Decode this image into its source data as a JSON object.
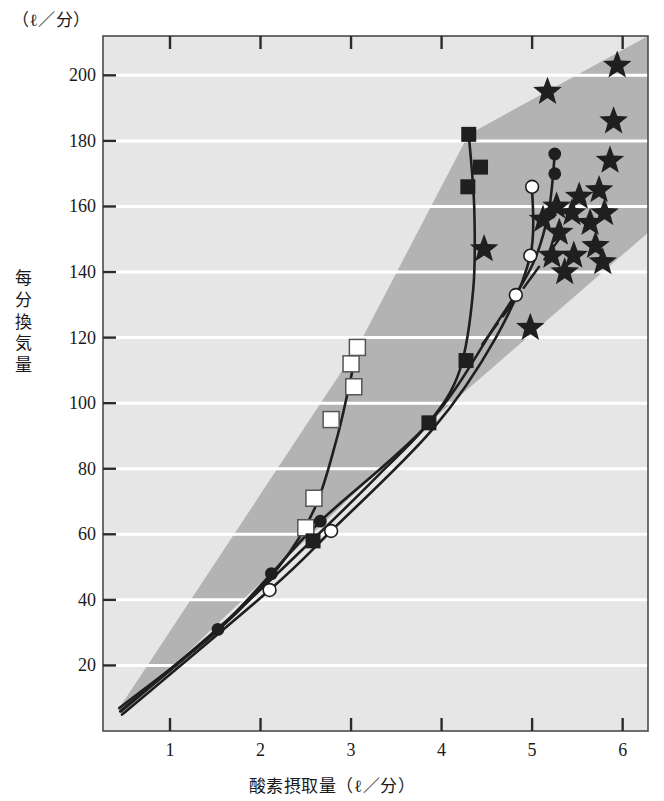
{
  "chart_data": {
    "type": "scatter",
    "title": "",
    "xlabel": "酸素摂取量（ℓ／分）",
    "ylabel": "每分換気量",
    "yunit_label": "（ℓ／分）",
    "xlim": [
      0.26,
      6.28
    ],
    "ylim": [
      0,
      212
    ],
    "xticks": [
      1,
      2,
      3,
      4,
      5,
      6
    ],
    "yticks": [
      20,
      40,
      60,
      80,
      100,
      120,
      140,
      160,
      180,
      200
    ],
    "grid": "horizontal-white-lines",
    "legend_position": "none",
    "colors": {
      "plot_background": "#e6e6e6",
      "band_fill": "#b3b3b3",
      "marker_dark": "#1f1f1f",
      "marker_open_fill": "#ffffff",
      "axis": "#4a4a4a",
      "gridline": "#ffffff"
    },
    "series": [
      {
        "name": "open-squares",
        "marker": "open-square",
        "points": [
          [
            2.5,
            62
          ],
          [
            2.59,
            71
          ],
          [
            2.78,
            95
          ],
          [
            3.03,
            105
          ],
          [
            3.0,
            112
          ],
          [
            3.07,
            117
          ]
        ]
      },
      {
        "name": "filled-squares",
        "marker": "filled-square",
        "points": [
          [
            2.58,
            58
          ],
          [
            3.86,
            94
          ],
          [
            4.27,
            113
          ],
          [
            4.29,
            166
          ],
          [
            4.43,
            172
          ],
          [
            4.3,
            182
          ]
        ]
      },
      {
        "name": "filled-circles",
        "marker": "filled-circle",
        "points": [
          [
            1.53,
            31
          ],
          [
            2.12,
            48
          ],
          [
            2.66,
            64
          ],
          [
            3.86,
            94
          ],
          [
            4.82,
            133
          ],
          [
            5.2,
            158
          ],
          [
            5.25,
            170
          ],
          [
            5.25,
            176
          ]
        ]
      },
      {
        "name": "open-circles",
        "marker": "open-circle",
        "points": [
          [
            2.1,
            43
          ],
          [
            2.78,
            61
          ],
          [
            4.82,
            133
          ],
          [
            4.98,
            145
          ],
          [
            5.0,
            166
          ]
        ]
      },
      {
        "name": "stars",
        "marker": "star",
        "points": [
          [
            4.47,
            147
          ],
          [
            4.98,
            123
          ],
          [
            5.17,
            195
          ],
          [
            5.27,
            160
          ],
          [
            5.3,
            152
          ],
          [
            5.44,
            158
          ],
          [
            5.46,
            145
          ],
          [
            5.52,
            163
          ],
          [
            5.64,
            155
          ],
          [
            5.7,
            148
          ],
          [
            5.74,
            165
          ],
          [
            5.78,
            143
          ],
          [
            5.8,
            158
          ],
          [
            5.86,
            174
          ],
          [
            5.9,
            186
          ],
          [
            5.94,
            203
          ],
          [
            5.12,
            156
          ],
          [
            5.22,
            145
          ],
          [
            5.36,
            140
          ]
        ]
      }
    ],
    "band": {
      "description": "shaded corridor of normal response",
      "vertices": [
        [
          0.44,
          7
        ],
        [
          3.07,
          117
        ],
        [
          4.3,
          182
        ],
        [
          6.28,
          212
        ],
        [
          6.28,
          152
        ],
        [
          3.86,
          94
        ],
        [
          0.47,
          5
        ]
      ]
    },
    "curves": [
      {
        "name": "open-square-curve",
        "points": [
          [
            0.44,
            7
          ],
          [
            1.5,
            30
          ],
          [
            2.2,
            50
          ],
          [
            2.6,
            68
          ],
          [
            2.85,
            90
          ],
          [
            3.0,
            108
          ],
          [
            3.07,
            117
          ]
        ]
      },
      {
        "name": "filled-square-curve",
        "points": [
          [
            0.45,
            6
          ],
          [
            1.6,
            33
          ],
          [
            2.6,
            59
          ],
          [
            3.3,
            78
          ],
          [
            3.86,
            94
          ],
          [
            4.2,
            110
          ],
          [
            4.35,
            135
          ],
          [
            4.36,
            160
          ],
          [
            4.3,
            182
          ]
        ]
      },
      {
        "name": "filled-circle-curve",
        "points": [
          [
            0.46,
            6
          ],
          [
            1.53,
            31
          ],
          [
            2.12,
            48
          ],
          [
            2.66,
            64
          ],
          [
            3.86,
            94
          ],
          [
            4.6,
            124
          ],
          [
            5.0,
            142
          ],
          [
            5.18,
            158
          ],
          [
            5.25,
            176
          ]
        ]
      },
      {
        "name": "open-circle-curve",
        "points": [
          [
            0.47,
            5
          ],
          [
            2.1,
            43
          ],
          [
            2.78,
            61
          ],
          [
            3.9,
            92
          ],
          [
            4.6,
            120
          ],
          [
            4.98,
            145
          ],
          [
            5.0,
            166
          ]
        ]
      },
      {
        "name": "dashed-boundary",
        "points": [
          [
            4.45,
            118
          ],
          [
            4.85,
            133
          ],
          [
            5.35,
            152
          ]
        ]
      }
    ]
  }
}
